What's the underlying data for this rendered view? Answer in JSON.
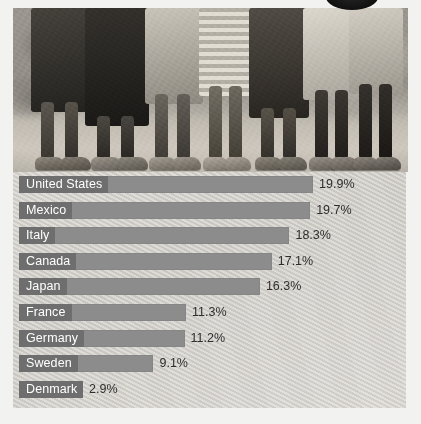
{
  "photo": {
    "alt_description": "Black and white photograph of the legs and feet of several people standing on dry ground in front of a rocky wall",
    "figures": [
      {
        "shorts_tone": "#3a3833",
        "skin_tone": "#55504a",
        "shoe_tone": "#6f6a62"
      },
      {
        "shorts_tone": "#2e2c28",
        "skin_tone": "#4a463f",
        "shoe_tone": "#7d786f"
      },
      {
        "shorts_tone": "#b6b1a7",
        "skin_tone": "#5a564e",
        "shoe_tone": "#8a857b"
      },
      {
        "shorts_tone": "#dad5cb",
        "skin_tone": "#635e55",
        "shoe_tone": "#a29d93"
      },
      {
        "shorts_tone": "#4a463f",
        "skin_tone": "#514c45",
        "shoe_tone": "#6b665e"
      },
      {
        "shorts_tone": "#cfcabf",
        "skin_tone": "#3f3b35",
        "shoe_tone": "#918c82"
      },
      {
        "shorts_tone": "#c6c1b6",
        "skin_tone": "#2f2c27",
        "shoe_tone": "#7a756c"
      }
    ]
  },
  "top_oval": {
    "icon": "dark-oval-badge"
  },
  "chart_data": {
    "type": "bar",
    "orientation": "horizontal",
    "title": "",
    "subtitle": "",
    "xlabel": "",
    "ylabel": "",
    "xlim": [
      0,
      20
    ],
    "grid": false,
    "legend": null,
    "value_suffix": "%",
    "categories": [
      "United States",
      "Mexico",
      "Italy",
      "Canada",
      "Japan",
      "France",
      "Germany",
      "Sweden",
      "Denmark"
    ],
    "values": [
      19.9,
      19.7,
      18.3,
      17.1,
      16.3,
      11.3,
      11.2,
      9.1,
      2.9
    ],
    "value_labels": [
      "19.9%",
      "19.7%",
      "18.3%",
      "17.1%",
      "16.3%",
      "11.3%",
      "11.2%",
      "9.1%",
      "2.9%"
    ],
    "colors": {
      "bar": "#8c8c8c",
      "label_block": "#6e6e6e",
      "label_text": "#ffffff",
      "value_text": "#2e2e2e",
      "panel_background": "#d4d1cb"
    }
  }
}
